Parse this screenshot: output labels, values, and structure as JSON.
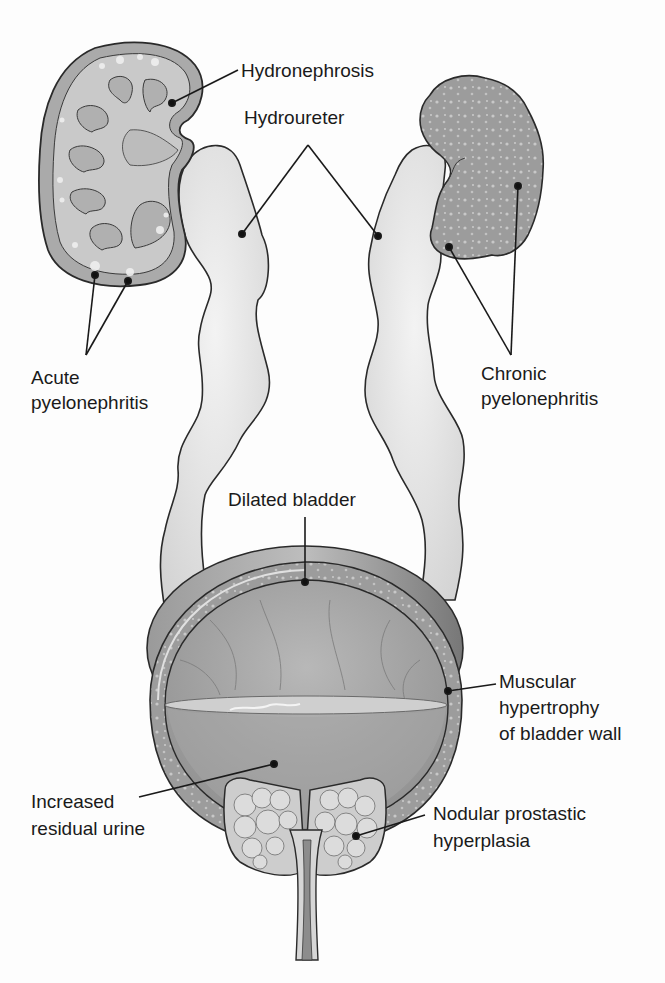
{
  "figure": {
    "colors": {
      "background": "#fdfdfd",
      "ureter_fill": "#e4e4e4",
      "kidney_fill": "#b5b5b5",
      "chronic_kidney_fill": "#9a9a9a",
      "bladder_wall": "#8c8c8c",
      "bladder_lumen": "#a9a9a9",
      "outline": "#2a2a2a",
      "text": "#1a1a1a"
    }
  },
  "labels": {
    "hydronephrosis": [
      "Hydronephrosis"
    ],
    "hydroureter": [
      "Hydroureter"
    ],
    "acute_pyelonephritis": [
      "Acute",
      "pyelonephritis"
    ],
    "chronic_pyelonephritis": [
      "Chronic",
      "pyelonephritis"
    ],
    "dilated_bladder": [
      "Dilated bladder"
    ],
    "muscular_hypertrophy": [
      "Muscular",
      "hypertrophy",
      "of bladder wall"
    ],
    "increased_residual_urine": [
      "Increased",
      "residual urine"
    ],
    "nodular_prostatic_hyperplasia": [
      "Nodular prostastic",
      "hyperplasia"
    ]
  }
}
